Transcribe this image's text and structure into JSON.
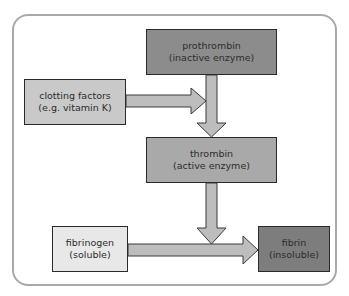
{
  "diagram": {
    "nodes": [
      {
        "id": "prothrombin",
        "line1": "prothrombin",
        "line2": "(inactive enzyme)",
        "fill": "#8c8c8c"
      },
      {
        "id": "clotting_factors",
        "line1": "clotting factors",
        "line2": "(e.g. vitamin K)",
        "fill": "#c9c9c9"
      },
      {
        "id": "thrombin",
        "line1": "thrombin",
        "line2": "(active enzyme)",
        "fill": "#a9a9a9"
      },
      {
        "id": "fibrinogen",
        "line1": "fibrinogen",
        "line2": "(soluble)",
        "fill": "#e8e8e8"
      },
      {
        "id": "fibrin",
        "line1": "fibrin",
        "line2": "(insoluble)",
        "fill": "#7d7d7d"
      }
    ],
    "edges": [
      {
        "from": "clotting_factors",
        "to": "prothrombin-thrombin-arrow"
      },
      {
        "from": "prothrombin",
        "to": "thrombin"
      },
      {
        "from": "thrombin",
        "to": "fibrinogen-fibrin-arrow"
      },
      {
        "from": "fibrinogen",
        "to": "fibrin"
      }
    ],
    "arrow_fill": "#bdbdbd",
    "arrow_stroke": "#3a3a3a",
    "frame_stroke": "#a9a9a9"
  }
}
